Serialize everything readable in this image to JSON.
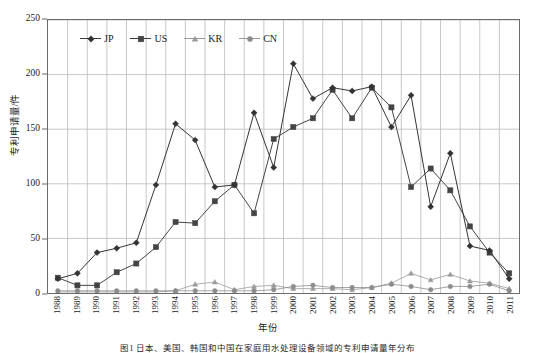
{
  "chart_data": {
    "type": "line",
    "title": "",
    "xlabel": "年份",
    "ylabel": "专利申请量/件",
    "ylim": [
      0,
      250
    ],
    "yticks": [
      0,
      50,
      100,
      150,
      200,
      250
    ],
    "grid": true,
    "legend_position": "top-left-inside",
    "categories": [
      "1988",
      "1989",
      "1990",
      "1991",
      "1992",
      "1993",
      "1994",
      "1995",
      "1996",
      "1997",
      "1998",
      "1999",
      "2000",
      "2001",
      "2002",
      "2003",
      "2004",
      "2005",
      "2006",
      "2007",
      "2008",
      "2009",
      "2010",
      "2011"
    ],
    "series": [
      {
        "name": "JP",
        "marker": "diamond",
        "color": "#333333",
        "values": [
          13,
          18,
          37,
          41,
          46,
          99,
          155,
          140,
          97,
          99,
          165,
          115,
          210,
          178,
          188,
          185,
          189,
          152,
          181,
          79,
          128,
          43,
          39,
          13
        ]
      },
      {
        "name": "US",
        "marker": "square",
        "color": "#444444",
        "values": [
          14,
          7,
          7,
          19,
          27,
          42,
          65,
          64,
          84,
          99,
          73,
          141,
          152,
          160,
          186,
          160,
          188,
          170,
          97,
          114,
          94,
          61,
          37,
          18
        ]
      },
      {
        "name": "KR",
        "marker": "triangle",
        "color": "#9a9a9a",
        "values": [
          1,
          1,
          1,
          1,
          1,
          1,
          2,
          8,
          10,
          3,
          6,
          7,
          4,
          4,
          4,
          3,
          5,
          9,
          18,
          12,
          17,
          11,
          9,
          4
        ]
      },
      {
        "name": "CN",
        "marker": "circle",
        "color": "#8c8c8c",
        "values": [
          2,
          2,
          2,
          2,
          2,
          2,
          2,
          2,
          2,
          2,
          2,
          3,
          6,
          7,
          5,
          5,
          5,
          8,
          6,
          3,
          6,
          6,
          8,
          2
        ]
      }
    ]
  },
  "axes": {
    "y_title": "专利申请量/件",
    "x_title": "年份",
    "y_tick_labels": [
      "250",
      "200",
      "150",
      "100",
      "50",
      "0"
    ]
  },
  "legend": {
    "items": [
      {
        "label": "JP",
        "marker": "diamond"
      },
      {
        "label": "US",
        "marker": "square"
      },
      {
        "label": "KR",
        "marker": "triangle"
      },
      {
        "label": "CN",
        "marker": "circle"
      }
    ]
  },
  "caption": {
    "text": "图1  日本、美国、韩国和中国在家庭用水处理设备领域的专利申请量年分布"
  }
}
